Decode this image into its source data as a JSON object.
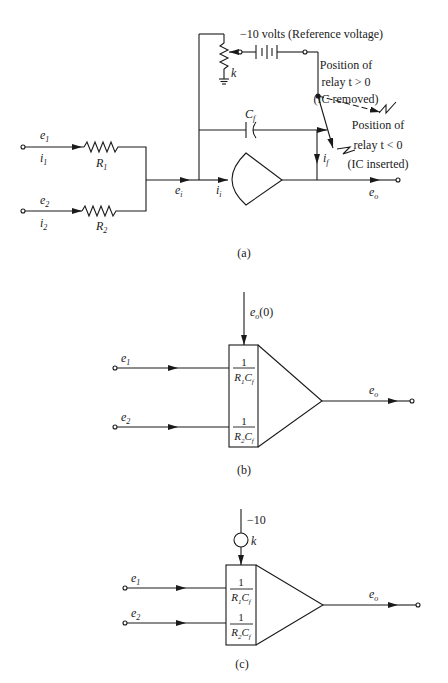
{
  "figure": {
    "panel_a": {
      "caption": "(a)",
      "reference_voltage_label": "−10 volts (Reference voltage)",
      "potentiometer_label": "k",
      "capacitor_label": "C",
      "capacitor_sub": "f",
      "relay_top": [
        "Position of",
        "relay  t > 0",
        "(IC removed)"
      ],
      "relay_bottom": [
        "Position of",
        "relay  t < 0",
        "(IC inserted)"
      ],
      "inputs": [
        {
          "voltage": "e",
          "vsub": "1",
          "current": "i",
          "isub": "1",
          "resistor": "R",
          "rsub": "1"
        },
        {
          "voltage": "e",
          "vsub": "2",
          "current": "i",
          "isub": "2",
          "resistor": "R",
          "rsub": "2"
        }
      ],
      "summing_voltage": {
        "base": "e",
        "sub": "i"
      },
      "summing_current": {
        "base": "i",
        "sub": "i"
      },
      "feedback_current": {
        "base": "i",
        "sub": "f"
      },
      "output": {
        "base": "e",
        "sub": "o"
      }
    },
    "panel_b": {
      "caption": "(b)",
      "initial_condition": {
        "base": "e",
        "sub": "o",
        "suffix": "(0)"
      },
      "inputs": [
        {
          "base": "e",
          "sub": "1",
          "gain_num": "1",
          "gain_den": "R",
          "gain_den_sub": "1",
          "gain_den_tail": "C",
          "gain_den_tail_sub": "f"
        },
        {
          "base": "e",
          "sub": "2",
          "gain_num": "1",
          "gain_den": "R",
          "gain_den_sub": "2",
          "gain_den_tail": "C",
          "gain_den_tail_sub": "f"
        }
      ],
      "output": {
        "base": "e",
        "sub": "o"
      }
    },
    "panel_c": {
      "caption": "(c)",
      "reference": "−10",
      "potentiometer_label": "k",
      "inputs": [
        {
          "base": "e",
          "sub": "1",
          "gain_num": "1",
          "gain_den": "R",
          "gain_den_sub": "1",
          "gain_den_tail": "C",
          "gain_den_tail_sub": "f"
        },
        {
          "base": "e",
          "sub": "2",
          "gain_num": "1",
          "gain_den": "R",
          "gain_den_sub": "2",
          "gain_den_tail": "C",
          "gain_den_tail_sub": "f"
        }
      ],
      "output": {
        "base": "e",
        "sub": "o"
      }
    }
  }
}
